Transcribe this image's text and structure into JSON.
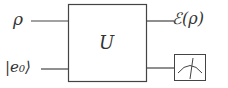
{
  "diagram": {
    "type": "quantum-circuit",
    "inputs": [
      {
        "label": "ρ"
      },
      {
        "label": "|e₀⟩"
      }
    ],
    "gate": {
      "label": "U"
    },
    "outputs": [
      {
        "label": "ℰ(ρ)"
      },
      {
        "label": "measurement",
        "icon": "meter-icon"
      }
    ],
    "colors": {
      "stroke": "#444444",
      "background": "#ffffff"
    }
  }
}
